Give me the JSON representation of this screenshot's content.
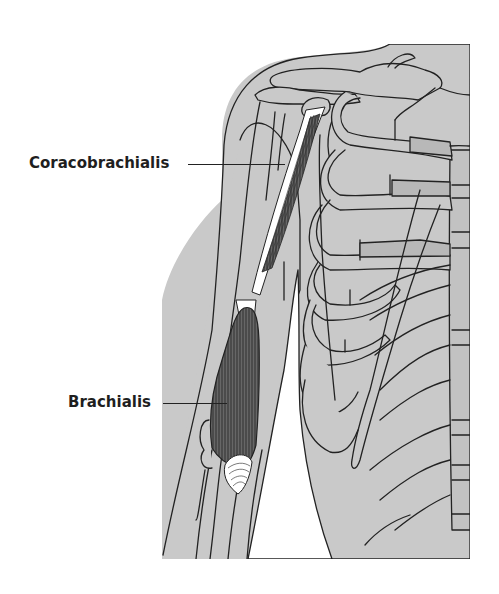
{
  "figure": {
    "colors": {
      "background": "#ffffff",
      "tissue": "#c9c9c9",
      "bone_dark": "#b5b5b5",
      "outline": "#222222",
      "muscle_highlight": "#4a4a4a",
      "tendon": "#ffffff"
    }
  },
  "labels": [
    {
      "id": "coracobrachialis",
      "text": "Coracobrachialis"
    },
    {
      "id": "brachialis",
      "text": "Brachialis"
    }
  ]
}
